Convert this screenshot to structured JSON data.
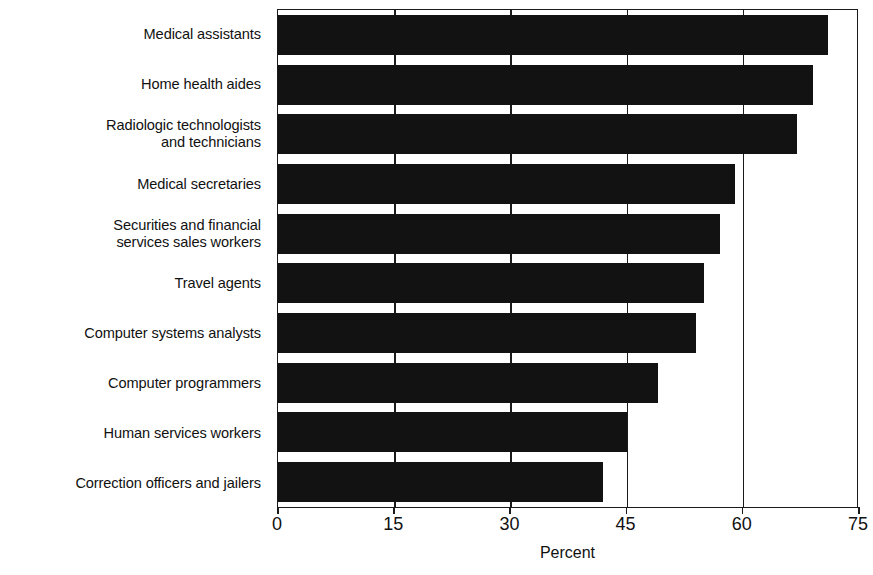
{
  "chart_data": {
    "type": "bar",
    "orientation": "horizontal",
    "title": "",
    "xlabel": "Percent",
    "ylabel": "",
    "xlim": [
      0,
      75
    ],
    "xticks": [
      0,
      15,
      30,
      45,
      60,
      75
    ],
    "xtick_labels": [
      "0",
      "15",
      "30",
      "45",
      "60",
      "75"
    ],
    "grid": true,
    "gridlines_at": [
      15,
      30,
      45,
      60
    ],
    "legend": null,
    "bar_color": "#121212",
    "categories": [
      "Medical assistants",
      "Home health aides",
      "Radiologic technologists\nand technicians",
      "Medical secretaries",
      "Securities and financial\nservices sales workers",
      "Travel agents",
      "Computer systems analysts",
      "Computer programmers",
      "Human services workers",
      "Correction officers and jailers"
    ],
    "values": [
      71,
      69,
      67,
      59,
      57,
      55,
      54,
      49,
      45,
      42
    ]
  }
}
